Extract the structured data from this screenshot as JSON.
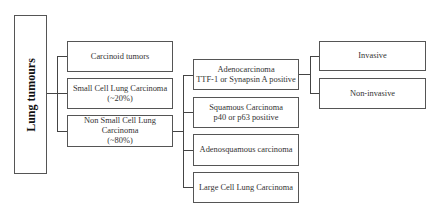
{
  "diagram": {
    "root": {
      "label": "Lung tumours"
    },
    "level1": [
      {
        "lines": [
          "Carcinoid tumors"
        ]
      },
      {
        "lines": [
          "Small Cell Lung Carcinoma",
          "(~20%)"
        ]
      },
      {
        "lines": [
          "Non Small Cell Lung",
          "Carcinoma",
          "(~80%)"
        ]
      }
    ],
    "level2": [
      {
        "lines": [
          "Adenocarcinoma",
          "TTF-1 or Synapsin A positive"
        ]
      },
      {
        "lines": [
          "Squamous Carcinoma",
          "p40 or p63 positive"
        ]
      },
      {
        "lines": [
          "Adenosquamous carcinoma"
        ]
      },
      {
        "lines": [
          "Large Cell Lung Carcinoma"
        ]
      }
    ],
    "level3": [
      {
        "lines": [
          "Invasive"
        ]
      },
      {
        "lines": [
          "Non-invasive"
        ]
      }
    ],
    "edges": [
      [
        "Lung tumours",
        "Carcinoid tumors"
      ],
      [
        "Lung tumours",
        "Small Cell Lung Carcinoma"
      ],
      [
        "Lung tumours",
        "Non Small Cell Lung Carcinoma"
      ],
      [
        "Non Small Cell Lung Carcinoma",
        "Adenocarcinoma"
      ],
      [
        "Non Small Cell Lung Carcinoma",
        "Squamous Carcinoma"
      ],
      [
        "Non Small Cell Lung Carcinoma",
        "Adenosquamous carcinoma"
      ],
      [
        "Non Small Cell Lung Carcinoma",
        "Large Cell Lung Carcinoma"
      ],
      [
        "Adenocarcinoma",
        "Invasive"
      ],
      [
        "Adenocarcinoma",
        "Non-invasive"
      ]
    ]
  }
}
